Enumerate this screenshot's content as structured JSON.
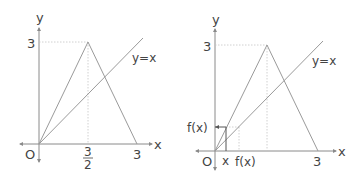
{
  "left_graph": {
    "y_axis_label": "y",
    "x_axis_label": "x",
    "origin_label": "O",
    "y_tick_label": "3",
    "x_tick_mid_numerator": "3",
    "x_tick_mid_denominator": "2",
    "x_tick_end_label": "3",
    "line_label": "y=x"
  },
  "right_graph": {
    "y_axis_label": "y",
    "x_axis_label": "x",
    "origin_label": "O",
    "y_tick_label": "3",
    "fx_y_label": "f(x)",
    "x_tick_label": "x",
    "fx_x_label": "f(x)",
    "x_tick_end_label": "3",
    "line_label": "y=x"
  }
}
